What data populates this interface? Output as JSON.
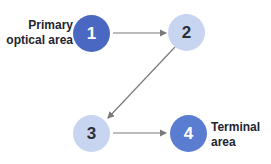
{
  "diagram": {
    "nodes": [
      {
        "id": "1",
        "label": "1",
        "caption": "Primary optical area",
        "caption_lines": [
          "Primary",
          "optical area"
        ],
        "color": "#4a68c2",
        "text_color": "#ffffff"
      },
      {
        "id": "2",
        "label": "2",
        "caption": "",
        "color": "#c8d5f0",
        "text_color": "#2a2f3a"
      },
      {
        "id": "3",
        "label": "3",
        "caption": "",
        "color": "#c8d5f0",
        "text_color": "#2a2f3a"
      },
      {
        "id": "4",
        "label": "4",
        "caption": "Terminal area",
        "caption_lines": [
          "Terminal",
          "area"
        ],
        "color": "#5b7dd1",
        "text_color": "#ffffff"
      }
    ],
    "edges": [
      {
        "from": "1",
        "to": "2"
      },
      {
        "from": "2",
        "to": "3"
      },
      {
        "from": "3",
        "to": "4"
      }
    ],
    "arrow_color": "#7a7a7a"
  }
}
